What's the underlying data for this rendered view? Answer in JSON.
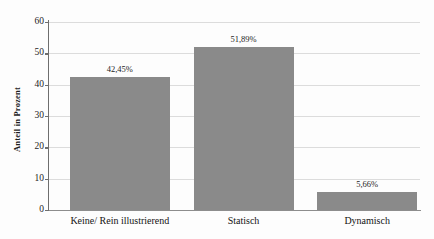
{
  "chart_data": {
    "type": "bar",
    "title": "",
    "xlabel": "",
    "ylabel": "Anteil in Prozent",
    "categories": [
      "Keine/ Rein illustrierend",
      "Statisch",
      "Dynamisch"
    ],
    "values": [
      42.45,
      51.89,
      5.66
    ],
    "value_labels": [
      "42,45%",
      "51,89%",
      "5,66%"
    ],
    "ylim": [
      0,
      60
    ],
    "yticks": [
      0,
      10,
      20,
      30,
      40,
      50,
      60
    ],
    "ytick_labels": [
      "0",
      "10",
      "20",
      "30",
      "40",
      "50",
      "60"
    ],
    "grid": true,
    "legend": false,
    "bar_color": "#8a8a8a",
    "background_color": "#fdfdfd",
    "gridline_color": "#dcdcdc",
    "axis_color": "#6e6e6e"
  }
}
